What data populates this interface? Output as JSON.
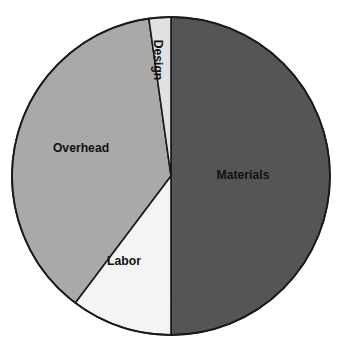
{
  "chart_data": {
    "type": "pie",
    "title": "",
    "subtitle": "",
    "xlabel": "",
    "ylabel": "",
    "legend_position": "none",
    "grid": false,
    "labels_inside_slices": true,
    "categories": [
      "Materials",
      "Overhead",
      "Labor",
      "Design"
    ],
    "values": [
      50,
      37.5,
      10,
      2.5
    ],
    "units": "percent",
    "slices": [
      {
        "label": "Materials",
        "value": 50,
        "percent": 50,
        "color": "#555558",
        "start_angle_deg": 0,
        "end_angle_deg": 180,
        "label_x": 243,
        "label_y": 176,
        "label_rotation_deg": 0
      },
      {
        "label": "Overhead",
        "value": 37.5,
        "percent": 37.5,
        "color": "#a9a9a9",
        "start_angle_deg": 217,
        "end_angle_deg": 352,
        "label_x": 81,
        "label_y": 149,
        "label_rotation_deg": 0
      },
      {
        "label": "Labor",
        "value": 10,
        "percent": 10,
        "color": "#f4f4f4",
        "start_angle_deg": 180,
        "end_angle_deg": 217,
        "label_x": 124,
        "label_y": 262,
        "label_rotation_deg": 0
      },
      {
        "label": "Design",
        "value": 2.5,
        "percent": 2.5,
        "color": "#e1e1e1",
        "start_angle_deg": 352,
        "end_angle_deg": 360,
        "label_x": 157,
        "label_y": 60,
        "label_rotation_deg": 90
      }
    ],
    "geometry": {
      "center_x": 171,
      "center_y": 176,
      "radius": 159
    },
    "style": {
      "outline_color": "#1a1a1a",
      "background": "#ffffff",
      "label_color": "#111111"
    }
  }
}
